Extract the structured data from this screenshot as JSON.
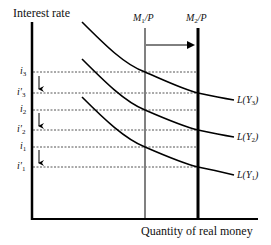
{
  "diagram": {
    "y_axis_label": "Interest rate",
    "x_axis_label": "Quantity of real money",
    "supply_lines": [
      {
        "name": "M1/P",
        "base": "M",
        "sub": "1",
        "suffix": "/P",
        "style": "gray",
        "color": "#808080"
      },
      {
        "name": "M2/P",
        "base": "M",
        "sub": "2",
        "suffix": "/P",
        "style": "black-thick",
        "color": "#000000"
      }
    ],
    "shift_arrow": {
      "from": "M1/P",
      "to": "M2/P",
      "direction": "right"
    },
    "interest_levels": [
      {
        "name": "i3",
        "base": "i",
        "prime": "",
        "sub": "3"
      },
      {
        "name": "i'3",
        "base": "i",
        "prime": "'",
        "sub": "3"
      },
      {
        "name": "i2",
        "base": "i",
        "prime": "",
        "sub": "2"
      },
      {
        "name": "i'2",
        "base": "i",
        "prime": "'",
        "sub": "2"
      },
      {
        "name": "i1",
        "base": "i",
        "prime": "",
        "sub": "1"
      },
      {
        "name": "i'1",
        "base": "i",
        "prime": "'",
        "sub": "1"
      }
    ],
    "demand_curves": [
      {
        "name": "L(Y3)",
        "prefix": "L(Y",
        "sub": "3",
        "suffix": ")"
      },
      {
        "name": "L(Y2)",
        "prefix": "L(Y",
        "sub": "2",
        "suffix": ")"
      },
      {
        "name": "L(Y1)",
        "prefix": "L(Y",
        "sub": "1",
        "suffix": ")"
      }
    ],
    "down_arrows": [
      "i3 to i'3",
      "i2 to i'2",
      "i1 to i'1"
    ]
  }
}
